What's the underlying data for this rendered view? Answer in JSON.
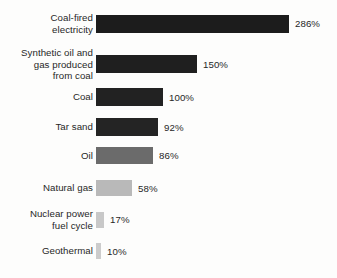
{
  "chart_data": {
    "type": "bar",
    "orientation": "horizontal",
    "title": "",
    "subtitle": "",
    "xlabel": "",
    "ylabel": "",
    "grid": false,
    "legend": null,
    "axis_visible": false,
    "value_suffix": "%",
    "xlim": [
      0,
      286
    ],
    "categories": [
      "Coal-fired\nelectricity",
      "Synthetic oil and\ngas produced\nfrom coal",
      "Coal",
      "Tar sand",
      "Oil",
      "Natural gas",
      "Nuclear power\nfuel cycle",
      "Geothermal"
    ],
    "values": [
      286,
      150,
      100,
      92,
      86,
      58,
      17,
      10
    ],
    "value_labels": [
      "286%",
      "150%",
      "100%",
      "92%",
      "86%",
      "58%",
      "17%",
      "10%"
    ],
    "bar_colors": [
      "#1c1c1c",
      "#1f1f1f",
      "#222222",
      "#242424",
      "#6b6b6b",
      "#b9b9b9",
      "#c8c8c8",
      "#cccccc"
    ]
  },
  "bars": [
    {
      "label": "Coal-fired\nelectricity",
      "value_label": "286%",
      "width_px": 193,
      "color": "#1c1c1c",
      "top_px": 12,
      "height_px": 18
    },
    {
      "label": "Synthetic oil and\ngas produced\nfrom coal",
      "value_label": "150%",
      "width_px": 101,
      "color": "#1f1f1f",
      "top_px": 51,
      "height_px": 18
    },
    {
      "label": "Coal",
      "value_label": "100%",
      "width_px": 67,
      "color": "#222222",
      "top_px": 88,
      "height_px": 18
    },
    {
      "label": "Tar sand",
      "value_label": "92%",
      "width_px": 62,
      "color": "#242424",
      "top_px": 118,
      "height_px": 18
    },
    {
      "label": "Oil",
      "value_label": "86%",
      "width_px": 57,
      "color": "#6b6b6b",
      "top_px": 147,
      "height_px": 17
    },
    {
      "label": "Natural gas",
      "value_label": "58%",
      "width_px": 36,
      "color": "#b9b9b9",
      "top_px": 180,
      "height_px": 16
    },
    {
      "label": "Nuclear power\nfuel cycle",
      "value_label": "17%",
      "width_px": 8,
      "color": "#c8c8c8",
      "top_px": 212,
      "height_px": 16
    },
    {
      "label": "Geothermal",
      "value_label": "10%",
      "width_px": 5,
      "color": "#cccccc",
      "top_px": 243,
      "height_px": 16
    }
  ]
}
